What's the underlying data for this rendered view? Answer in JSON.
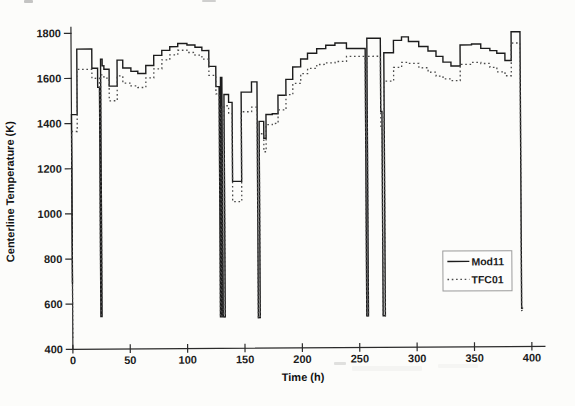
{
  "chart_data": {
    "type": "line",
    "subtype": "step-after",
    "title": "",
    "xlabel": "Time (h)",
    "ylabel": "Centerline Temperature (K)",
    "xlim": [
      0,
      400
    ],
    "ylim": [
      400,
      1800
    ],
    "x_ticks": [
      0,
      50,
      100,
      150,
      200,
      250,
      300,
      350,
      400
    ],
    "y_ticks": [
      400,
      600,
      800,
      1000,
      1200,
      1400,
      1600,
      1800
    ],
    "grid": "off",
    "legend_position": "lower-right",
    "axis_color": "#2b2b2b",
    "series": [
      {
        "name": "Mod11",
        "style": "solid",
        "color": "#1c1c1c",
        "points": [
          [
            0,
            690
          ],
          [
            0,
            1440
          ],
          [
            5,
            1730
          ],
          [
            18,
            1645
          ],
          [
            23,
            1560
          ],
          [
            24.6,
            545
          ],
          [
            25.6,
            1685
          ],
          [
            27,
            1655
          ],
          [
            28.5,
            1640
          ],
          [
            33,
            1565
          ],
          [
            40,
            1680
          ],
          [
            45,
            1645
          ],
          [
            52,
            1630
          ],
          [
            58,
            1620
          ],
          [
            65,
            1655
          ],
          [
            72,
            1700
          ],
          [
            79,
            1722
          ],
          [
            86,
            1738
          ],
          [
            93,
            1752
          ],
          [
            101,
            1745
          ],
          [
            108,
            1735
          ],
          [
            114,
            1720
          ],
          [
            120,
            1650
          ],
          [
            126,
            1560
          ],
          [
            128.8,
            540
          ],
          [
            130,
            1600
          ],
          [
            131.2,
            540
          ],
          [
            133,
            1525
          ],
          [
            137,
            1490
          ],
          [
            140,
            1140
          ],
          [
            148,
            1535
          ],
          [
            157,
            1580
          ],
          [
            161.8,
            535
          ],
          [
            163.5,
            1405
          ],
          [
            167.5,
            1330
          ],
          [
            169.5,
            1435
          ],
          [
            175,
            1438
          ],
          [
            180,
            1520
          ],
          [
            187,
            1590
          ],
          [
            193,
            1645
          ],
          [
            200,
            1680
          ],
          [
            206,
            1705
          ],
          [
            214,
            1725
          ],
          [
            222,
            1740
          ],
          [
            230,
            1750
          ],
          [
            240,
            1725
          ],
          [
            256.3,
            540
          ],
          [
            257.8,
            1770
          ],
          [
            269.5,
            1445
          ],
          [
            270.6,
            540
          ],
          [
            272.5,
            1705
          ],
          [
            281,
            1760
          ],
          [
            288,
            1775
          ],
          [
            294,
            1755
          ],
          [
            303,
            1732
          ],
          [
            311,
            1712
          ],
          [
            318,
            1688
          ],
          [
            324,
            1662
          ],
          [
            331,
            1645
          ],
          [
            339,
            1738
          ],
          [
            349,
            1742
          ],
          [
            357,
            1722
          ],
          [
            365,
            1712
          ],
          [
            371,
            1700
          ],
          [
            378,
            1668
          ],
          [
            383.5,
            1795
          ],
          [
            391.3,
            570
          ],
          [
            392.6,
            570
          ]
        ]
      },
      {
        "name": "TFC01",
        "style": "dotted",
        "color": "#4a4a4a",
        "points": [
          [
            0,
            450
          ],
          [
            0,
            1365
          ],
          [
            5,
            1640
          ],
          [
            18,
            1600
          ],
          [
            24.6,
            545
          ],
          [
            25.6,
            1615
          ],
          [
            28.5,
            1600
          ],
          [
            33,
            1500
          ],
          [
            40,
            1610
          ],
          [
            45,
            1578
          ],
          [
            52,
            1565
          ],
          [
            58,
            1558
          ],
          [
            65,
            1600
          ],
          [
            72,
            1640
          ],
          [
            79,
            1680
          ],
          [
            86,
            1702
          ],
          [
            93,
            1722
          ],
          [
            101,
            1712
          ],
          [
            108,
            1700
          ],
          [
            114,
            1682
          ],
          [
            120,
            1610
          ],
          [
            126,
            1528
          ],
          [
            128.8,
            540
          ],
          [
            130,
            1470
          ],
          [
            131.2,
            540
          ],
          [
            133,
            1475
          ],
          [
            137,
            1440
          ],
          [
            140,
            1050
          ],
          [
            148,
            1448
          ],
          [
            157,
            1468
          ],
          [
            161.8,
            535
          ],
          [
            163.5,
            1350
          ],
          [
            167.5,
            1270
          ],
          [
            169.5,
            1390
          ],
          [
            175,
            1395
          ],
          [
            180,
            1455
          ],
          [
            187,
            1522
          ],
          [
            193,
            1572
          ],
          [
            200,
            1615
          ],
          [
            206,
            1638
          ],
          [
            214,
            1655
          ],
          [
            222,
            1662
          ],
          [
            230,
            1668
          ],
          [
            240,
            1690
          ],
          [
            256.3,
            540
          ],
          [
            257.8,
            1690
          ],
          [
            269.5,
            1380
          ],
          [
            270.6,
            540
          ],
          [
            272.5,
            1580
          ],
          [
            281,
            1640
          ],
          [
            288,
            1662
          ],
          [
            294,
            1658
          ],
          [
            303,
            1638
          ],
          [
            311,
            1618
          ],
          [
            318,
            1600
          ],
          [
            324,
            1588
          ],
          [
            331,
            1580
          ],
          [
            339,
            1652
          ],
          [
            349,
            1660
          ],
          [
            357,
            1655
          ],
          [
            365,
            1638
          ],
          [
            371,
            1618
          ],
          [
            378,
            1600
          ],
          [
            383.5,
            1745
          ],
          [
            391.3,
            560
          ],
          [
            392.6,
            560
          ]
        ]
      }
    ]
  }
}
